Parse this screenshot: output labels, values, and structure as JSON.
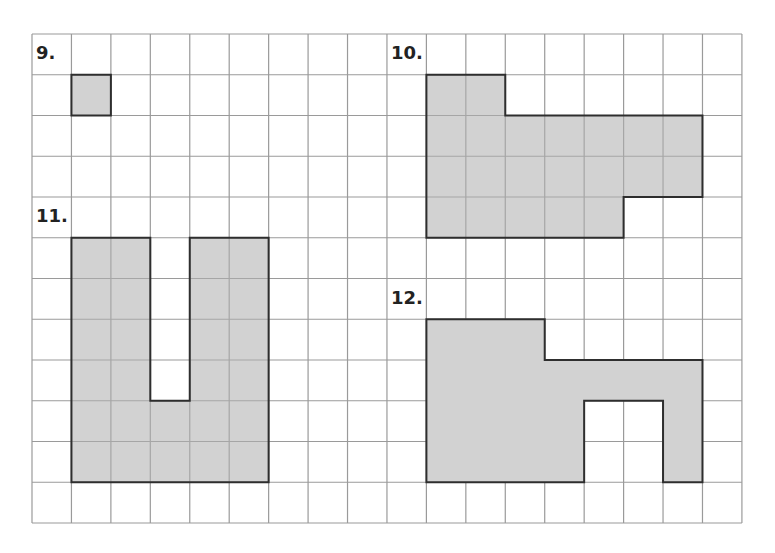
{
  "grid": {
    "origin_x": 32,
    "origin_y": 34,
    "cols": 18,
    "rows": 12,
    "cell_w": 39.44,
    "cell_h": 40.75,
    "line_color": "#9a9a9a",
    "border_color": "#8a8a8a"
  },
  "style": {
    "fill_color": "#d2d2d2",
    "outline_color": "#2e2e2e",
    "background": "#ffffff"
  },
  "problems": [
    {
      "number": "9.",
      "label_cell": [
        0,
        0
      ],
      "polygon": [
        [
          1,
          1
        ],
        [
          2,
          1
        ],
        [
          2,
          2
        ],
        [
          1,
          2
        ]
      ],
      "show_interior_grid": true
    },
    {
      "number": "10.",
      "label_cell": [
        9,
        0
      ],
      "polygon": [
        [
          10,
          1
        ],
        [
          12,
          1
        ],
        [
          12,
          2
        ],
        [
          17,
          2
        ],
        [
          17,
          4
        ],
        [
          15,
          4
        ],
        [
          15,
          5
        ],
        [
          10,
          5
        ]
      ],
      "show_interior_grid": true
    },
    {
      "number": "11.",
      "label_cell": [
        0,
        4
      ],
      "polygon": [
        [
          1,
          5
        ],
        [
          3,
          5
        ],
        [
          3,
          9
        ],
        [
          4,
          9
        ],
        [
          4,
          5
        ],
        [
          6,
          5
        ],
        [
          6,
          11
        ],
        [
          1,
          11
        ]
      ],
      "show_interior_grid": true
    },
    {
      "number": "12.",
      "label_cell": [
        9,
        6
      ],
      "polygon": [
        [
          10,
          7
        ],
        [
          13,
          7
        ],
        [
          13,
          8
        ],
        [
          17,
          8
        ],
        [
          17,
          11
        ],
        [
          16,
          11
        ],
        [
          16,
          9
        ],
        [
          14,
          9
        ],
        [
          14,
          11
        ],
        [
          10,
          11
        ]
      ],
      "show_interior_grid": false
    }
  ]
}
